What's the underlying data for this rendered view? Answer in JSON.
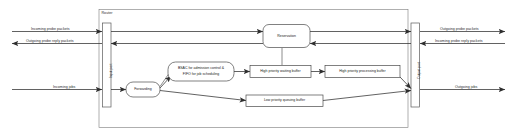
{
  "diagram": {
    "frame_label": "Router",
    "ports": {
      "input": "Input port",
      "output": "Output port"
    },
    "nodes": {
      "forwarding": "Forwarding",
      "bsac_line1": "BSAC for admission control &",
      "bsac_line2": "FIFO for job scheduling",
      "reservation": "Reservation",
      "hp_waiting": "High priority waiting buffer",
      "hp_processing": "High priority processing buffer",
      "lp_queuing": "Low priority queuing buffer"
    },
    "external_labels": {
      "left_top": "Incoming probe packets",
      "left_second": "Outgoing probe reply packets",
      "left_bottom": "Incoming jobs",
      "right_top": "Outgoing probe packets",
      "right_second": "Incoming probe reply packets",
      "right_bottom": "Outgoing jobs"
    },
    "colors": {
      "stroke": "#3a3a3a",
      "text": "#1f1f1f",
      "background": "#ffffff"
    }
  }
}
